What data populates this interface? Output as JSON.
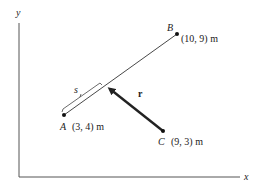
{
  "axes": {
    "x_label": "x",
    "y_label": "y"
  },
  "points": {
    "A": {
      "name": "A",
      "coords": "(3, 4) m"
    },
    "B": {
      "name": "B",
      "coords": "(10, 9) m"
    },
    "C": {
      "name": "C",
      "coords": "(9, 3) m"
    }
  },
  "vectors": {
    "r": {
      "label": "r"
    }
  },
  "segment": {
    "s_label": "s"
  },
  "colors": {
    "line": "#333333",
    "axis": "#555555",
    "arrow": "#222222"
  }
}
